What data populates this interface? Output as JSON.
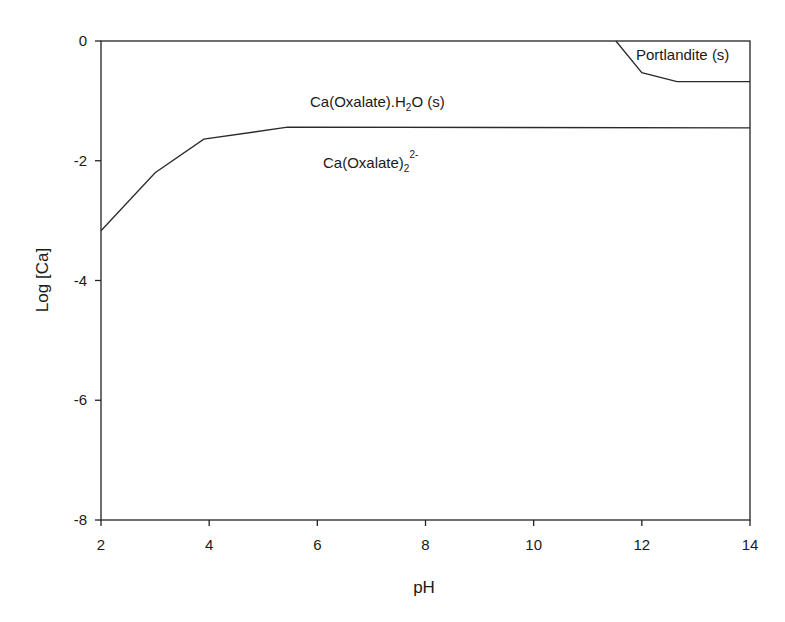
{
  "chart_data": {
    "type": "line",
    "title": "",
    "xlabel": "pH",
    "ylabel": "Log [Ca]",
    "xlim": [
      2,
      14
    ],
    "ylim": [
      -8,
      0
    ],
    "xticks": [
      2,
      4,
      6,
      8,
      10,
      12,
      14
    ],
    "yticks": [
      0,
      -2,
      -4,
      -6,
      -8
    ],
    "grid": false,
    "legend": null,
    "series": [
      {
        "name": "Ca(Oxalate).H2O (s) / Ca(Oxalate)2 2- boundary",
        "x": [
          2.0,
          3.0,
          3.9,
          5.45,
          14.0
        ],
        "y": [
          -3.17,
          -2.2,
          -1.64,
          -1.44,
          -1.45
        ]
      },
      {
        "name": "Portlandite (s) boundary",
        "x": [
          11.52,
          12.0,
          12.65,
          14.0
        ],
        "y": [
          0.0,
          -0.53,
          -0.68,
          -0.68
        ]
      }
    ],
    "annotations": [
      {
        "text": "Portlandite (s)",
        "x": 12.6,
        "y": -0.3
      },
      {
        "text": "Ca(Oxalate).H2O (s)",
        "x": 7.1,
        "y": -1.0
      },
      {
        "text": "Ca(Oxalate)2 2-",
        "x": 7.3,
        "y": -2.0
      }
    ]
  },
  "labels": {
    "x_axis_title": "pH",
    "y_axis_title": "Log [Ca]",
    "portlandite": "Portlandite (s)",
    "oxalate_solid_main": "Ca(Oxalate).H",
    "oxalate_solid_sub": "2",
    "oxalate_solid_tail": "O (s)",
    "oxalate_aq_main": "Ca(Oxalate)",
    "oxalate_aq_sub": "2",
    "oxalate_aq_sup": "2-"
  }
}
